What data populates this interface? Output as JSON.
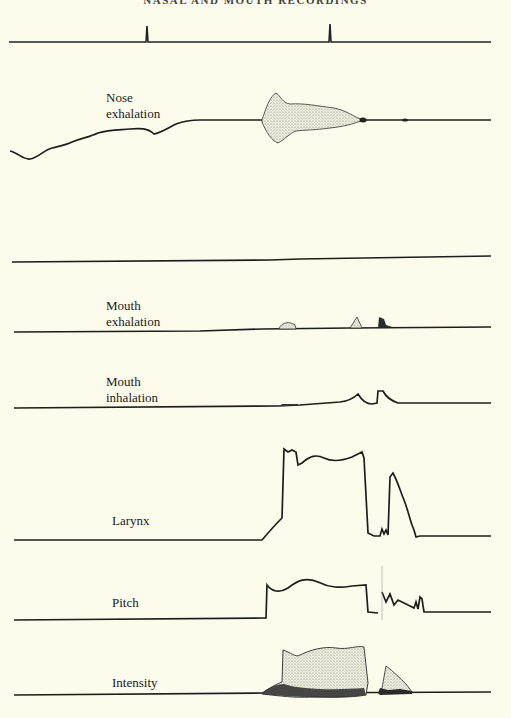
{
  "page": {
    "running_header": "NASAL AND MOUTH RECORDINGS",
    "background_color": "#fdfcec",
    "ink_color": "#1a1a1a"
  },
  "figure": {
    "type": "multi-channel physiological recording",
    "channels": [
      {
        "id": "timing",
        "label": ""
      },
      {
        "id": "nose-exhalation",
        "label_line1": "Nose",
        "label_line2": "exhalation"
      },
      {
        "id": "nose-inhalation",
        "label": ""
      },
      {
        "id": "mouth-exhalation",
        "label_line1": "Mouth",
        "label_line2": "exhalation"
      },
      {
        "id": "mouth-inhalation",
        "label_line1": "Mouth",
        "label_line2": "inhalation"
      },
      {
        "id": "larynx",
        "label": "Larynx"
      },
      {
        "id": "pitch",
        "label": "Pitch"
      },
      {
        "id": "intensity",
        "label": "Intensity"
      }
    ]
  }
}
